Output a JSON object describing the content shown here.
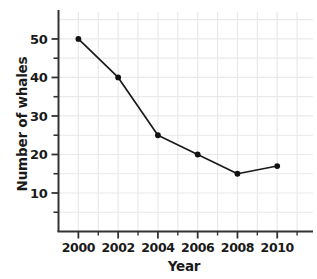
{
  "chart_data": {
    "type": "line",
    "title": "",
    "xlabel": "Year",
    "ylabel": "Number of whales",
    "x": [
      2000,
      2002,
      2004,
      2006,
      2008,
      2010
    ],
    "values": [
      50,
      40,
      25,
      20,
      15,
      17
    ],
    "series": [
      {
        "name": "Number of whales",
        "values": [
          50,
          40,
          25,
          20,
          15,
          17
        ]
      }
    ],
    "xlim": [
      1999,
      2011.8
    ],
    "ylim": [
      0,
      57
    ],
    "x_major_ticks": [
      2000,
      2002,
      2004,
      2006,
      2008,
      2010
    ],
    "x_tick_labels": [
      "2000",
      "2002",
      "2004",
      "2006",
      "2008",
      "2010"
    ],
    "x_minor_ticks": [
      2001,
      2003,
      2005,
      2007,
      2009,
      2011
    ],
    "y_major_ticks": [
      10,
      20,
      30,
      40,
      50
    ],
    "y_tick_labels": [
      "10",
      "20",
      "30",
      "40",
      "50"
    ],
    "y_minor_ticks": [
      5,
      15,
      25,
      35,
      45
    ],
    "grid": true,
    "grid_color": "#e9e9e9",
    "legend": "none",
    "line_color": "#1a1a1a",
    "marker": "circle",
    "marker_color": "#111111",
    "background": "#ffffff"
  },
  "axes": {
    "x_title": "Year",
    "y_title": "Number of whales"
  }
}
